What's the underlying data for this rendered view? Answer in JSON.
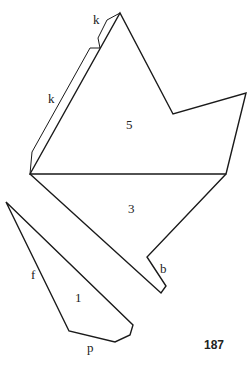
{
  "diagram": {
    "pieces": [
      {
        "id": "5",
        "label": "5"
      },
      {
        "id": "3",
        "label": "3"
      },
      {
        "id": "1",
        "label": "1"
      }
    ],
    "flap_labels": {
      "k_upper": "k",
      "k_lower": "k",
      "b": "b",
      "f": "f",
      "p": "p"
    },
    "page_number": "187",
    "stroke_color": "#1a1a1a",
    "background": "#ffffff"
  }
}
